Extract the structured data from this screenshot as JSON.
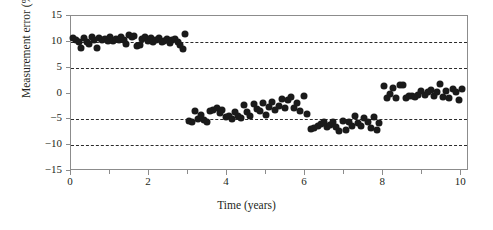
{
  "chart_data": {
    "type": "scatter",
    "title": "",
    "xlabel": "Time (years)",
    "ylabel": "Measurement error (%)",
    "xlim": [
      0,
      10.2
    ],
    "ylim": [
      -15,
      15
    ],
    "xticks": [
      0,
      2,
      4,
      6,
      8,
      10
    ],
    "xtick_labels": [
      "0",
      "2",
      "4",
      "6",
      "8",
      "10"
    ],
    "xminor_ticks": [
      1,
      3,
      5,
      7,
      9
    ],
    "yticks": [
      15,
      10,
      5,
      0,
      -5,
      -10,
      -15
    ],
    "ytick_labels": [
      "15",
      "10",
      "5",
      "0",
      "−5",
      "−10",
      "−15"
    ],
    "gridlines_y": [
      10,
      5,
      -5,
      -10
    ],
    "grid": "horizontal-dashed",
    "legend": "none",
    "marker_color": "#1a1a1a",
    "marker_size_px": 7,
    "segments": [
      {
        "name": "segment-1",
        "x_range": [
          0.0,
          2.9
        ],
        "level": 10.2
      },
      {
        "name": "segment-2",
        "x_range": [
          3.0,
          6.1
        ],
        "level": -3.0
      },
      {
        "name": "segment-3",
        "x_range": [
          6.2,
          7.9
        ],
        "level": -6.0
      },
      {
        "name": "segment-4",
        "x_range": [
          8.0,
          10.1
        ],
        "level": 0.3
      }
    ],
    "points": [
      [
        0.05,
        10.8
      ],
      [
        0.12,
        10.4
      ],
      [
        0.2,
        9.9
      ],
      [
        0.26,
        8.8
      ],
      [
        0.33,
        10.7
      ],
      [
        0.4,
        10.0
      ],
      [
        0.47,
        9.5
      ],
      [
        0.54,
        10.9
      ],
      [
        0.6,
        10.4
      ],
      [
        0.66,
        8.8
      ],
      [
        0.73,
        10.8
      ],
      [
        0.8,
        10.3
      ],
      [
        0.87,
        10.5
      ],
      [
        0.94,
        10.1
      ],
      [
        1.01,
        11.0
      ],
      [
        1.08,
        10.2
      ],
      [
        1.15,
        10.6
      ],
      [
        1.22,
        10.4
      ],
      [
        1.29,
        10.9
      ],
      [
        1.36,
        10.3
      ],
      [
        1.42,
        9.6
      ],
      [
        1.49,
        11.3
      ],
      [
        1.56,
        10.9
      ],
      [
        1.62,
        11.1
      ],
      [
        1.69,
        9.1
      ],
      [
        1.76,
        9.3
      ],
      [
        1.83,
        10.6
      ],
      [
        1.9,
        11.0
      ],
      [
        1.97,
        10.2
      ],
      [
        2.04,
        10.7
      ],
      [
        2.11,
        10.0
      ],
      [
        2.18,
        10.4
      ],
      [
        2.25,
        10.8
      ],
      [
        2.32,
        9.9
      ],
      [
        2.39,
        10.2
      ],
      [
        2.46,
        10.5
      ],
      [
        2.53,
        9.8
      ],
      [
        2.6,
        10.3
      ],
      [
        2.67,
        10.6
      ],
      [
        2.74,
        9.9
      ],
      [
        2.8,
        9.3
      ],
      [
        2.86,
        8.7
      ],
      [
        2.92,
        11.5
      ],
      [
        3.02,
        -5.3
      ],
      [
        3.09,
        -5.6
      ],
      [
        3.17,
        -3.4
      ],
      [
        3.25,
        -5.0
      ],
      [
        3.33,
        -4.2
      ],
      [
        3.41,
        -5.2
      ],
      [
        3.49,
        -5.5
      ],
      [
        3.57,
        -3.4
      ],
      [
        3.65,
        -3.2
      ],
      [
        3.73,
        -2.8
      ],
      [
        3.81,
        -3.8
      ],
      [
        3.88,
        -3.1
      ],
      [
        3.96,
        -4.6
      ],
      [
        4.04,
        -4.4
      ],
      [
        4.12,
        -5.0
      ],
      [
        4.2,
        -3.6
      ],
      [
        4.28,
        -4.3
      ],
      [
        4.36,
        -4.8
      ],
      [
        4.44,
        -2.3
      ],
      [
        4.52,
        -3.6
      ],
      [
        4.6,
        -4.4
      ],
      [
        4.68,
        -2.0
      ],
      [
        4.76,
        -3.0
      ],
      [
        4.84,
        -3.4
      ],
      [
        4.92,
        -1.9
      ],
      [
        5.0,
        -4.2
      ],
      [
        5.08,
        -2.6
      ],
      [
        5.16,
        -1.6
      ],
      [
        5.24,
        -3.1
      ],
      [
        5.32,
        -2.5
      ],
      [
        5.4,
        -1.0
      ],
      [
        5.48,
        -2.8
      ],
      [
        5.56,
        -1.2
      ],
      [
        5.64,
        -0.6
      ],
      [
        5.72,
        -2.8
      ],
      [
        5.8,
        -1.9
      ],
      [
        5.88,
        -3.3
      ],
      [
        5.96,
        -0.4
      ],
      [
        6.04,
        -3.9
      ],
      [
        6.16,
        -6.8
      ],
      [
        6.24,
        -6.6
      ],
      [
        6.32,
        -6.2
      ],
      [
        6.4,
        -5.9
      ],
      [
        6.48,
        -5.5
      ],
      [
        6.56,
        -6.5
      ],
      [
        6.64,
        -6.1
      ],
      [
        6.72,
        -5.6
      ],
      [
        6.8,
        -6.4
      ],
      [
        6.88,
        -7.2
      ],
      [
        6.96,
        -5.3
      ],
      [
        7.04,
        -7.0
      ],
      [
        7.12,
        -5.5
      ],
      [
        7.2,
        -6.3
      ],
      [
        7.28,
        -4.4
      ],
      [
        7.36,
        -5.7
      ],
      [
        7.44,
        -6.2
      ],
      [
        7.52,
        -4.8
      ],
      [
        7.6,
        -5.5
      ],
      [
        7.68,
        -6.6
      ],
      [
        7.76,
        -4.5
      ],
      [
        7.84,
        -7.0
      ],
      [
        7.9,
        -5.8
      ],
      [
        8.02,
        1.5
      ],
      [
        8.1,
        -0.9
      ],
      [
        8.18,
        -0.1
      ],
      [
        8.26,
        1.1
      ],
      [
        8.34,
        -0.9
      ],
      [
        8.42,
        1.6
      ],
      [
        8.5,
        1.6
      ],
      [
        8.58,
        -0.8
      ],
      [
        8.66,
        -0.4
      ],
      [
        8.74,
        -0.5
      ],
      [
        8.82,
        -0.6
      ],
      [
        8.9,
        -0.3
      ],
      [
        8.98,
        0.5
      ],
      [
        9.06,
        -0.3
      ],
      [
        9.14,
        0.2
      ],
      [
        9.22,
        0.6
      ],
      [
        9.3,
        -0.4
      ],
      [
        9.38,
        0.3
      ],
      [
        9.46,
        1.8
      ],
      [
        9.54,
        -0.6
      ],
      [
        9.62,
        0.4
      ],
      [
        9.7,
        -0.9
      ],
      [
        9.78,
        0.8
      ],
      [
        9.86,
        0.2
      ],
      [
        9.94,
        -1.2
      ],
      [
        10.02,
        0.9
      ]
    ]
  }
}
